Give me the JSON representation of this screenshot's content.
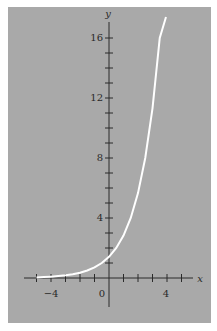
{
  "chart_data": {
    "type": "line",
    "title": "",
    "xlabel": "x",
    "ylabel": "y",
    "xlim": [
      -5.5,
      6.3
    ],
    "ylim": [
      -2.8,
      17.8
    ],
    "grid": false,
    "legend": null,
    "x_ticks": [
      -5,
      -4,
      -3,
      -2,
      -1,
      0,
      1,
      2,
      3,
      4,
      5
    ],
    "x_tick_labels": [
      {
        "value": -4,
        "label": "−4"
      },
      {
        "value": 0,
        "label": "0"
      },
      {
        "value": 4,
        "label": "4"
      }
    ],
    "y_ticks": [
      1,
      2,
      3,
      4,
      5,
      6,
      7,
      8,
      9,
      10,
      11,
      12,
      13,
      14,
      15,
      16
    ],
    "y_tick_labels": [
      {
        "value": 4,
        "label": "4"
      },
      {
        "value": 8,
        "label": "8"
      },
      {
        "value": 12,
        "label": "12"
      },
      {
        "value": 16,
        "label": "16"
      }
    ],
    "series": [
      {
        "name": "curve",
        "color": "#ffffff",
        "equation_estimated": "y ≈ 2^(x+0.5), fitted to pixel positions (not shown in image)",
        "values_are_estimates": true,
        "x": [
          -5,
          -4.5,
          -4,
          -3.5,
          -3,
          -2.5,
          -2,
          -1.5,
          -1,
          -0.5,
          0,
          0.5,
          1,
          1.5,
          2,
          2.5,
          3,
          3.5,
          3.93
        ],
        "y": [
          0.04,
          0.06,
          0.09,
          0.13,
          0.18,
          0.25,
          0.35,
          0.5,
          0.71,
          1.0,
          1.41,
          2.0,
          2.83,
          4.0,
          5.66,
          8.0,
          11.31,
          16.0,
          17.4
        ]
      }
    ]
  },
  "labels": {
    "x_axis": "x",
    "y_axis": "y",
    "x_tick_neg4": "−4",
    "x_tick_0": "0",
    "x_tick_4": "4",
    "y_tick_4": "4",
    "y_tick_8": "8",
    "y_tick_12": "12",
    "y_tick_16": "16"
  },
  "colors": {
    "background": "#a9a9a9",
    "axes": "#2a2a2a",
    "curve": "#ffffff"
  }
}
